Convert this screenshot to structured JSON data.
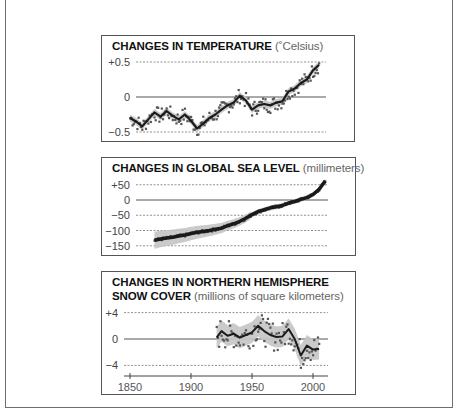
{
  "panels": {
    "temperature": {
      "title_bold": "CHANGES IN TEMPERATURE",
      "title_unit": "(˚Celsius)",
      "yticks": [
        "+0.5",
        "0",
        "−0.5"
      ]
    },
    "sea_level": {
      "title_bold": "CHANGES IN GLOBAL SEA LEVEL",
      "title_unit": "(millimeters)",
      "yticks": [
        "+50",
        "0",
        "−50",
        "−100",
        "−150"
      ]
    },
    "snow": {
      "title_bold_line1": "CHANGES IN NORTHERN HEMISPHERE",
      "title_bold_line2": "SNOW COVER",
      "title_unit": "(millions of square kilometers)",
      "yticks": [
        "+4",
        "0",
        "−4"
      ],
      "xticks": [
        "1850",
        "1900",
        "1950",
        "2000"
      ]
    }
  },
  "colors": {
    "line": "#1a1a1a",
    "points": "#555555",
    "band": "#c4c4c4",
    "grid": "#777777",
    "zero": "#555555"
  },
  "chart_data": [
    {
      "type": "line",
      "title": "CHANGES IN TEMPERATURE (˚Celsius)",
      "xlabel": "Year",
      "ylabel": "Temperature change (°C)",
      "ylim": [
        -0.55,
        0.55
      ],
      "xlim": [
        1850,
        2010
      ],
      "yticks": [
        0.5,
        0,
        -0.5
      ],
      "grid": "dashed at ±0.5, solid at 0",
      "series": [
        {
          "name": "decadal smoothed",
          "x": [
            1850,
            1855,
            1860,
            1865,
            1870,
            1875,
            1880,
            1885,
            1890,
            1895,
            1900,
            1905,
            1910,
            1915,
            1920,
            1925,
            1930,
            1935,
            1940,
            1945,
            1950,
            1955,
            1960,
            1965,
            1970,
            1975,
            1980,
            1985,
            1990,
            1995,
            2000,
            2005
          ],
          "values": [
            -0.3,
            -0.35,
            -0.42,
            -0.32,
            -0.22,
            -0.28,
            -0.2,
            -0.27,
            -0.32,
            -0.25,
            -0.34,
            -0.45,
            -0.38,
            -0.3,
            -0.25,
            -0.18,
            -0.12,
            -0.08,
            0.02,
            -0.05,
            -0.18,
            -0.12,
            -0.1,
            -0.12,
            -0.08,
            -0.06,
            0.08,
            0.12,
            0.2,
            0.25,
            0.38,
            0.46
          ]
        }
      ],
      "annual_points_range": [
        -0.58,
        0.52
      ]
    },
    {
      "type": "line",
      "title": "CHANGES IN GLOBAL SEA LEVEL (millimeters)",
      "xlabel": "Year",
      "ylabel": "Sea level change (mm)",
      "ylim": [
        -160,
        65
      ],
      "xlim": [
        1850,
        2010
      ],
      "yticks": [
        50,
        0,
        -50,
        -100,
        -150
      ],
      "series": [
        {
          "name": "sea level",
          "x": [
            1870,
            1875,
            1880,
            1885,
            1890,
            1895,
            1900,
            1905,
            1910,
            1915,
            1920,
            1925,
            1930,
            1935,
            1940,
            1945,
            1950,
            1955,
            1960,
            1965,
            1970,
            1975,
            1980,
            1985,
            1990,
            1995,
            2000,
            2005,
            2010
          ],
          "values": [
            -132,
            -128,
            -125,
            -122,
            -118,
            -115,
            -110,
            -106,
            -103,
            -100,
            -96,
            -92,
            -84,
            -78,
            -70,
            -60,
            -48,
            -38,
            -32,
            -26,
            -22,
            -18,
            -10,
            -5,
            2,
            8,
            18,
            35,
            62
          ]
        }
      ],
      "uncertainty_band": "wide (~±30mm) in early years, narrowing after ~1950"
    },
    {
      "type": "line",
      "title": "CHANGES IN NORTHERN HEMISPHERE SNOW COVER (millions of square kilometers)",
      "xlabel": "Year",
      "ylabel": "Snow cover change (million km²)",
      "ylim": [
        -4.5,
        4.5
      ],
      "xlim": [
        1850,
        2010
      ],
      "yticks": [
        4,
        0,
        -4
      ],
      "xticks": [
        1850,
        1900,
        1950,
        2000
      ],
      "series": [
        {
          "name": "smoothed",
          "x": [
            1921,
            1925,
            1930,
            1935,
            1940,
            1945,
            1950,
            1955,
            1960,
            1965,
            1970,
            1975,
            1980,
            1985,
            1990,
            1995,
            2000,
            2005
          ],
          "values": [
            0.2,
            1.2,
            0.5,
            0.8,
            0.2,
            0.6,
            1.0,
            2.0,
            1.2,
            0.6,
            0.3,
            0.4,
            1.5,
            0.0,
            -2.5,
            -1.0,
            -1.6,
            -1.5
          ]
        }
      ],
      "annual_points_range": [
        -4.0,
        3.5
      ]
    }
  ]
}
